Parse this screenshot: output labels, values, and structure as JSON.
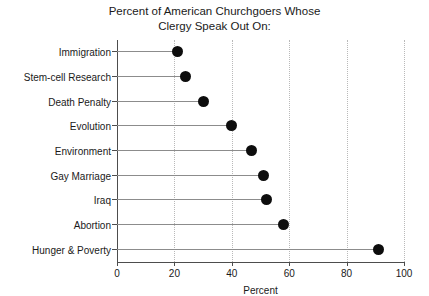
{
  "chart_data": {
    "type": "bar",
    "subtype": "lollipop-horizontal",
    "title": "Percent of American Churchgoers Whose\nClergy Speak Out On:",
    "xlabel": "Percent",
    "ylabel": "",
    "xlim": [
      0,
      100
    ],
    "xticks": [
      0,
      20,
      40,
      60,
      80,
      100
    ],
    "grid": "vertical-dotted",
    "legend": "none",
    "categories": [
      "Immigration",
      "Stem-cell Research",
      "Death Penalty",
      "Evolution",
      "Environment",
      "Gay Marriage",
      "Iraq",
      "Abortion",
      "Hunger & Poverty"
    ],
    "values": [
      21,
      24,
      30,
      40,
      47,
      51,
      52,
      58,
      91
    ],
    "colors": {
      "marker": "#0d0d0d",
      "stem": "#8c8c8c",
      "axis": "#4d4d4d",
      "grid": "#b9b9b9",
      "text": "#1a1a1a",
      "background": "#ffffff"
    }
  }
}
